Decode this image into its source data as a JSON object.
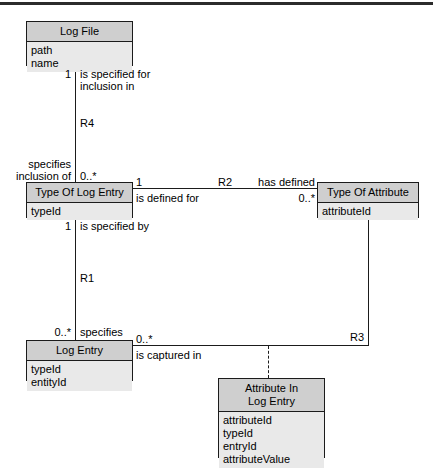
{
  "diagram": {
    "type": "entity-relationship-class-diagram",
    "top_rule": true,
    "entities": [
      {
        "id": "log-file",
        "name": "Log File",
        "attributes": [
          "path",
          "name"
        ]
      },
      {
        "id": "type-of-log-entry",
        "name": "Type Of Log Entry",
        "attributes": [
          "typeId"
        ]
      },
      {
        "id": "type-of-attribute",
        "name": "Type Of Attribute",
        "attributes": [
          "attributeId"
        ]
      },
      {
        "id": "log-entry",
        "name": "Log Entry",
        "attributes": [
          "typeId",
          "entityId"
        ]
      },
      {
        "id": "attribute-in-log-entry",
        "name": "Attribute In\nLog Entry",
        "attributes": [
          "attributeId",
          "typeId",
          "entryId",
          "attributeValue"
        ]
      }
    ],
    "relationships": [
      {
        "id": "R4",
        "label": "R4",
        "from": "log-file",
        "to": "type-of-log-entry",
        "from_multiplicity": "1",
        "from_role": "is specified for\ninclusion in",
        "to_multiplicity": "0..*",
        "to_role": "specifies\ninclusion of"
      },
      {
        "id": "R2",
        "label": "R2",
        "from": "type-of-log-entry",
        "to": "type-of-attribute",
        "from_multiplicity": "1",
        "from_role": "is defined for",
        "to_multiplicity": "0..*",
        "to_role": "has defined"
      },
      {
        "id": "R1",
        "label": "R1",
        "from": "type-of-log-entry",
        "to": "log-entry",
        "from_multiplicity": "1",
        "from_role": "is specified by",
        "to_multiplicity": "0..*",
        "to_role": "specifies"
      },
      {
        "id": "R3",
        "label": "R3",
        "from": "log-entry",
        "to": "type-of-attribute",
        "from_multiplicity": "0..*",
        "from_role": "is captured in",
        "association_class": "attribute-in-log-entry"
      }
    ]
  },
  "labels": {
    "r4_from_mult": "1",
    "r4_from_role": "is specified for\ninclusion in",
    "r4_name": "R4",
    "r4_to_role": "specifies\ninclusion of",
    "r4_to_mult": "0..*",
    "r2_from_mult": "1",
    "r2_from_role": "is defined for",
    "r2_name": "R2",
    "r2_to_role": "has defined",
    "r2_to_mult": "0..*",
    "r1_from_mult": "1",
    "r1_from_role": "is specified by",
    "r1_name": "R1",
    "r1_to_mult": "0..*",
    "r1_to_role": "specifies",
    "r3_from_mult": "0..*",
    "r3_from_role": "is captured in",
    "r3_name": "R3"
  },
  "colors": {
    "line": "#1b1b1b",
    "header_fill": "#cfcfcf",
    "body_fill": "#e9e9e9",
    "page_bg": "#ffffff"
  }
}
